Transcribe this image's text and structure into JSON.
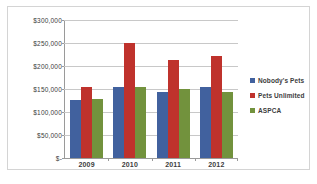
{
  "chart_data": {
    "type": "bar",
    "title": "",
    "subtitle": "",
    "xlabel": "",
    "ylabel": "",
    "categories": [
      "2009",
      "2010",
      "2011",
      "2012"
    ],
    "series": [
      {
        "name": "Nobody's Pets",
        "color": "#41619e",
        "values": [
          127000,
          155000,
          143000,
          154000
        ]
      },
      {
        "name": "Pets Unlimited",
        "color": "#bf322c",
        "values": [
          154000,
          251000,
          213000,
          221000
        ]
      },
      {
        "name": "ASPCA",
        "color": "#72923d",
        "values": [
          129000,
          155000,
          149000,
          144000
        ]
      }
    ],
    "ylim": [
      0,
      300000
    ],
    "ytick_values": [
      300000,
      250000,
      200000,
      150000,
      100000,
      50000,
      0
    ],
    "ytick_labels": [
      "$300,000",
      "$250,000",
      "$200,000",
      "$150,000",
      "$100,000",
      "$50,000",
      "$-"
    ],
    "grid": true,
    "legend_position": "right",
    "bar_orientation": "vertical"
  },
  "legend": {
    "items": [
      {
        "label": "Nobody's Pets"
      },
      {
        "label": "Pets Unlimited"
      },
      {
        "label": "ASPCA"
      }
    ]
  }
}
